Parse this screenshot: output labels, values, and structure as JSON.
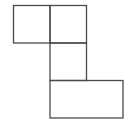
{
  "diagram": {
    "stroke_color": "#4a4a4a",
    "fill_color": "#ffffff",
    "shapes": [
      {
        "name": "top-left-square",
        "col": 0,
        "row": 0,
        "w": 1,
        "h": 1
      },
      {
        "name": "top-right-square",
        "col": 1,
        "row": 0,
        "w": 1,
        "h": 1
      },
      {
        "name": "middle-square",
        "col": 1,
        "row": 1,
        "w": 1,
        "h": 1
      },
      {
        "name": "bottom-rectangle",
        "col": 1,
        "row": 2,
        "w": 2,
        "h": 1
      }
    ]
  }
}
